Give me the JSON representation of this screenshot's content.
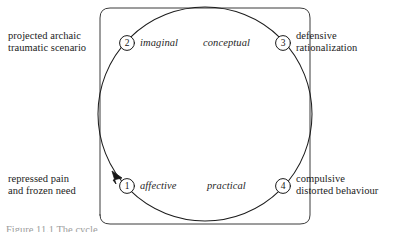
{
  "figure": {
    "caption": "Figure 11.1  The cycle",
    "ink_color": "#1b1b1b",
    "background_color": "#ffffff"
  },
  "diagram": {
    "type": "cycle",
    "direction": "counter-clockwise",
    "frame_shape": "rounded-rectangle-bracket",
    "nodes": [
      {
        "number": "1",
        "mode": "affective",
        "description_line1": "repressed pain",
        "description_line2": "and frozen need",
        "position": "bottom-left",
        "has_arrowhead": true
      },
      {
        "number": "2",
        "mode": "imaginal",
        "description_line1": "projected archaic",
        "description_line2": "traumatic scenario",
        "position": "top-left",
        "has_arrowhead": false
      },
      {
        "number": "3",
        "mode": "conceptual",
        "description_line1": "defensive",
        "description_line2": "rationalization",
        "position": "top-right",
        "has_arrowhead": false
      },
      {
        "number": "4",
        "mode": "practical",
        "description_line1": "compulsive",
        "description_line2": "distorted behaviour",
        "position": "bottom-right",
        "has_arrowhead": false
      }
    ]
  }
}
